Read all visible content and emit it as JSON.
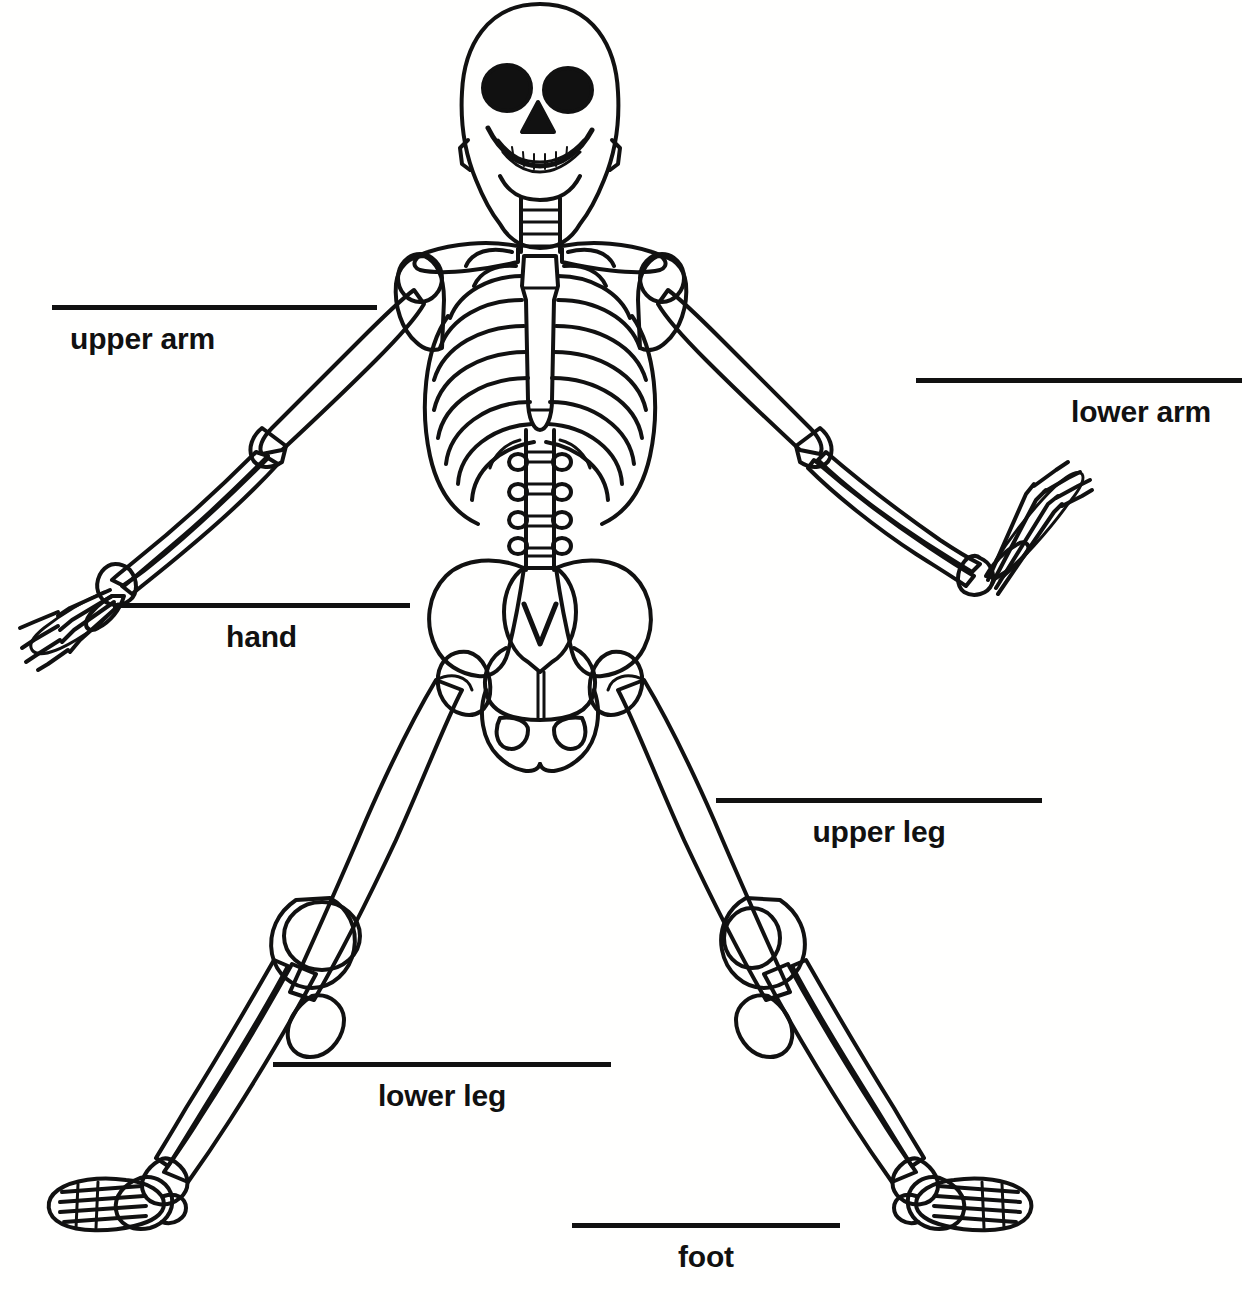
{
  "worksheet": {
    "title": "Human Skeleton Labeling Worksheet",
    "subject": "human-skeleton",
    "background_color": "#ffffff",
    "ink_color": "#111111"
  },
  "figure": {
    "name": "human-skeleton-front-view",
    "parts": [
      "skull",
      "cervical-spine",
      "clavicle",
      "scapula",
      "sternum",
      "ribcage",
      "lumbar-spine",
      "pelvis",
      "sacrum",
      "humerus",
      "radius",
      "ulna",
      "carpals",
      "metacarpals",
      "phalanges",
      "femur",
      "patella",
      "tibia",
      "fibula",
      "tarsals",
      "metatarsals"
    ]
  },
  "callouts": [
    {
      "id": "upper-arm",
      "label": "upper arm",
      "line_x": 52,
      "line_y": 305,
      "line_width": 325,
      "label_align": "center",
      "label_offset_x": -72
    },
    {
      "id": "lower-arm",
      "label": "lower arm",
      "line_x": 916,
      "line_y": 378,
      "line_width": 326,
      "label_align": "center",
      "label_offset_x": 62
    },
    {
      "id": "hand",
      "label": "hand",
      "line_x": 113,
      "line_y": 603,
      "line_width": 297,
      "label_align": "center",
      "label_offset_x": 0
    },
    {
      "id": "upper-leg",
      "label": "upper leg",
      "line_x": 716,
      "line_y": 798,
      "line_width": 326,
      "label_align": "center",
      "label_offset_x": 0
    },
    {
      "id": "lower-leg",
      "label": "lower leg",
      "line_x": 273,
      "line_y": 1062,
      "line_width": 338,
      "label_align": "center",
      "label_offset_x": 0
    },
    {
      "id": "foot",
      "label": "foot",
      "line_x": 572,
      "line_y": 1223,
      "line_width": 268,
      "label_align": "center",
      "label_offset_x": 0
    }
  ]
}
